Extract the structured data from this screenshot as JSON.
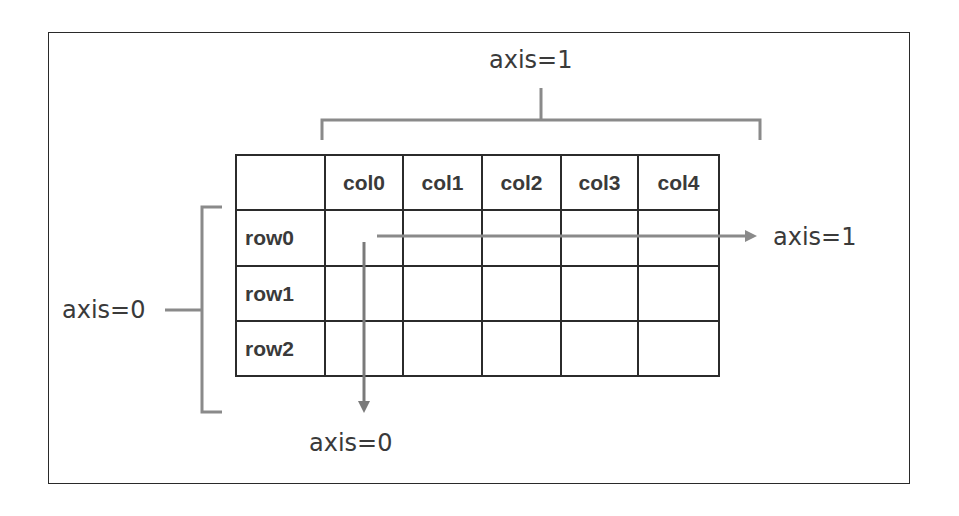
{
  "diagram": {
    "top_label": "axis=1",
    "left_label": "axis=0",
    "right_arrow_label": "axis=1",
    "bottom_arrow_label": "axis=0",
    "table": {
      "columns": [
        "",
        "col0",
        "col1",
        "col2",
        "col3",
        "col4"
      ],
      "rows": [
        {
          "label": "row0",
          "cells": [
            "",
            "",
            "",
            "",
            ""
          ]
        },
        {
          "label": "row1",
          "cells": [
            "",
            "",
            "",
            "",
            ""
          ]
        },
        {
          "label": "row2",
          "cells": [
            "",
            "",
            "",
            "",
            ""
          ]
        }
      ]
    },
    "colors": {
      "border": "#2b2b2b",
      "bracket": "#8a8a8a",
      "arrow": "#8a8a8a",
      "text": "#3a3a3a"
    }
  }
}
